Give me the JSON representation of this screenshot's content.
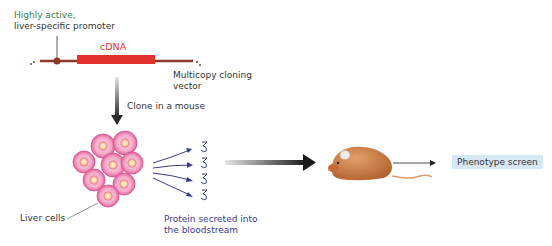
{
  "diagram": {
    "promoter_label": {
      "line1": "Highly active,",
      "line2": "liver-specific promoter"
    },
    "cdna_label": "cDNA",
    "vector_label": {
      "line1": "Multicopy cloning",
      "line2": "vector"
    },
    "step1_label": "Clone in a mouse",
    "liver_cells_label": "Liver cells",
    "protein_label": {
      "line1": "Protein secreted into",
      "line2": "the bloodstream"
    },
    "phenotype_label": "Phenotype screen",
    "colors": {
      "cdna": "#e53030",
      "vector": "#8b3a2a",
      "arrow_dark": "#2a2a2a",
      "protein": "#3a3a8c",
      "cell_pink": "#f2a8c8",
      "mouse": "#c97a45",
      "phenotype_bg": "#d7e8f5",
      "promoter_label": "#3d7a4a"
    }
  }
}
